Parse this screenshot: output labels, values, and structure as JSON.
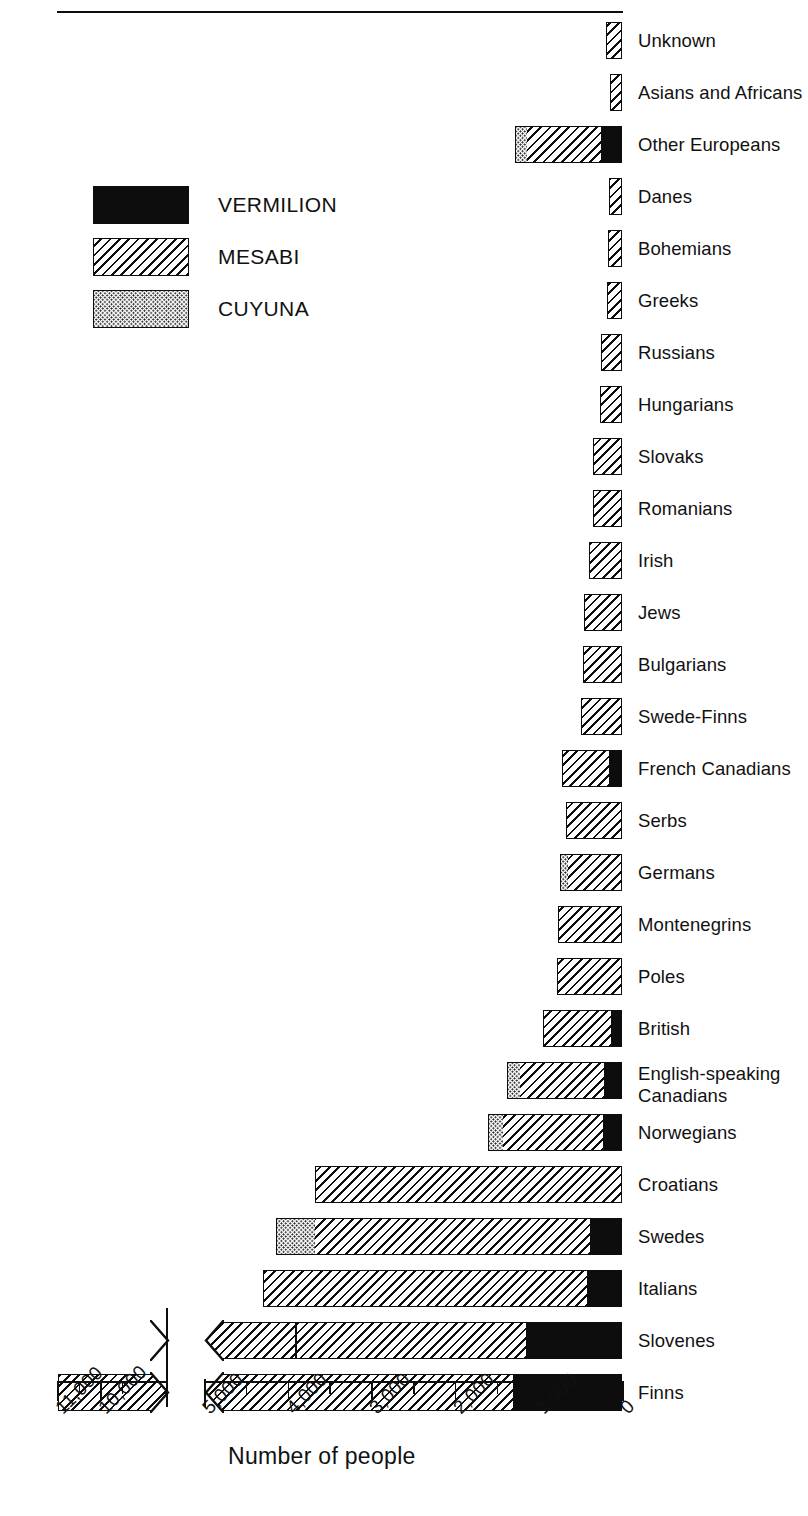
{
  "chart_data": {
    "type": "bar",
    "orientation": "horizontal-stacked",
    "title": "",
    "xlabel": "Number of people",
    "ylabel": "",
    "grid": false,
    "legend_position": "upper-left",
    "axis_direction": "right-to-left",
    "axis_break": true,
    "xticks_main": [
      "0",
      "1,000",
      "2,000",
      "3,000",
      "4,000",
      "5,000"
    ],
    "xticks_break_panel": [
      "10,000",
      "11,000"
    ],
    "minor_tick_interval": 500,
    "series": [
      {
        "name": "VERMILION",
        "pattern": "solid-black",
        "color": "#0d0d0d"
      },
      {
        "name": "MESABI",
        "pattern": "diagonal-hatch",
        "color": "#0d0d0d"
      },
      {
        "name": "CUYUNA",
        "pattern": "dotted",
        "color": "#1a1a1a"
      }
    ],
    "categories": [
      "Unknown",
      "Asians and Africans",
      "Other Europeans",
      "Danes",
      "Bohemians",
      "Greeks",
      "Russians",
      "Hungarians",
      "Slovaks",
      "Romanians",
      "Irish",
      "Jews",
      "Bulgarians",
      "Swede-Finns",
      "French Canadians",
      "Serbs",
      "Germans",
      "Montenegrins",
      "Poles",
      "British",
      "English-speaking\nCanadians",
      "Norwegians",
      "Croatians",
      "Swedes",
      "Italians",
      "Slovenes",
      "Finns"
    ],
    "rows": [
      {
        "label": "Unknown",
        "vermilion": 0,
        "mesabi": 190,
        "cuyuna": 0
      },
      {
        "label": "Asians and Africans",
        "vermilion": 0,
        "mesabi": 145,
        "cuyuna": 0
      },
      {
        "label": "Other Europeans",
        "vermilion": 265,
        "mesabi": 880,
        "cuyuna": 130
      },
      {
        "label": "Danes",
        "vermilion": 0,
        "mesabi": 155,
        "cuyuna": 0
      },
      {
        "label": "Bohemians",
        "vermilion": 0,
        "mesabi": 170,
        "cuyuna": 0
      },
      {
        "label": "Greeks",
        "vermilion": 0,
        "mesabi": 185,
        "cuyuna": 0
      },
      {
        "label": "Russians",
        "vermilion": 0,
        "mesabi": 250,
        "cuyuna": 0
      },
      {
        "label": "Hungarians",
        "vermilion": 0,
        "mesabi": 260,
        "cuyuna": 0
      },
      {
        "label": "Slovaks",
        "vermilion": 0,
        "mesabi": 345,
        "cuyuna": 0
      },
      {
        "label": "Romanians",
        "vermilion": 0,
        "mesabi": 350,
        "cuyuna": 0
      },
      {
        "label": "Irish",
        "vermilion": 0,
        "mesabi": 400,
        "cuyuna": 0
      },
      {
        "label": "Jews",
        "vermilion": 0,
        "mesabi": 455,
        "cuyuna": 0
      },
      {
        "label": "Bulgarians",
        "vermilion": 0,
        "mesabi": 470,
        "cuyuna": 0
      },
      {
        "label": "Swede-Finns",
        "vermilion": 0,
        "mesabi": 490,
        "cuyuna": 0
      },
      {
        "label": "French Canadians",
        "vermilion": 170,
        "mesabi": 545,
        "cuyuna": 0
      },
      {
        "label": "Serbs",
        "vermilion": 0,
        "mesabi": 665,
        "cuyuna": 0
      },
      {
        "label": "Germans",
        "vermilion": 0,
        "mesabi": 660,
        "cuyuna": 80
      },
      {
        "label": "Montenegrins",
        "vermilion": 0,
        "mesabi": 760,
        "cuyuna": 0
      },
      {
        "label": "Poles",
        "vermilion": 0,
        "mesabi": 780,
        "cuyuna": 0
      },
      {
        "label": "British",
        "vermilion": 140,
        "mesabi": 800,
        "cuyuna": 0
      },
      {
        "label": "English-speaking Canadians",
        "vermilion": 230,
        "mesabi": 1000,
        "cuyuna": 140
      },
      {
        "label": "Norwegians",
        "vermilion": 235,
        "mesabi": 1200,
        "cuyuna": 165
      },
      {
        "label": "Croatians",
        "vermilion": 0,
        "mesabi": 3670,
        "cuyuna": 0
      },
      {
        "label": "Swedes",
        "vermilion": 400,
        "mesabi": 3280,
        "cuyuna": 455
      },
      {
        "label": "Italians",
        "vermilion": 430,
        "mesabi": 3870,
        "cuyuna": 0
      },
      {
        "label": "Slovenes",
        "vermilion": 1160,
        "mesabi": 4300,
        "cuyuna": 0
      },
      {
        "label": "Finns",
        "vermilion": 1310,
        "mesabi": 9660,
        "cuyuna": 0
      }
    ]
  },
  "legend": {
    "items": [
      {
        "label": "VERMILION",
        "pattern": "vermilion"
      },
      {
        "label": "MESABI",
        "pattern": "mesabi"
      },
      {
        "label": "CUYUNA",
        "pattern": "cuyuna"
      }
    ]
  },
  "axis": {
    "title": "Number of people",
    "main_ticks": [
      {
        "value": 0,
        "label": "0"
      },
      {
        "value": 1000,
        "label": "1,000"
      },
      {
        "value": 2000,
        "label": "2,000"
      },
      {
        "value": 3000,
        "label": "3,000"
      },
      {
        "value": 4000,
        "label": "4,000"
      },
      {
        "value": 5000,
        "label": "5,000"
      }
    ],
    "break_ticks": [
      {
        "value": 10000,
        "label": "10,000"
      },
      {
        "value": 11000,
        "label": "11,000"
      }
    ]
  }
}
